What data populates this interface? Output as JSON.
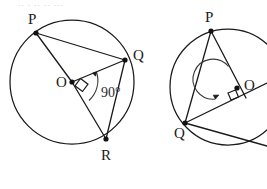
{
  "figure": {
    "title_strip": ".. .  .. .. ...",
    "stroke_color": "#1a1a1a",
    "background_color": "#ffffff",
    "panels": [
      {
        "name": "left-circle-figure",
        "center_label": "O",
        "vertex_labels": [
          "P",
          "Q",
          "R"
        ],
        "angle_label": "90°",
        "circle": {
          "cx": 72,
          "cy": 82,
          "r": 62
        },
        "center_point": {
          "x": 72,
          "y": 82
        },
        "points": {
          "P": {
            "x": 36,
            "y": 33
          },
          "Q": {
            "x": 125,
            "y": 60
          },
          "R": {
            "x": 106,
            "y": 139
          }
        },
        "segments": [
          {
            "from": "O",
            "to": "P"
          },
          {
            "from": "O",
            "to": "Q"
          },
          {
            "from": "O",
            "to": "R"
          },
          {
            "from": "P",
            "to": "Q"
          },
          {
            "from": "Q",
            "to": "R"
          }
        ],
        "right_angle_at": "O",
        "arc_between": [
          "Q",
          "R"
        ]
      },
      {
        "name": "right-circle-figure",
        "center_label": "O",
        "vertex_labels": [
          "P",
          "Q"
        ],
        "angle_label": "",
        "circle": {
          "cx": 228,
          "cy": 87,
          "r": 58
        },
        "center_point": {
          "x": 228,
          "y": 87
        },
        "points": {
          "P": {
            "x": 211,
            "y": 31
          },
          "Q": {
            "x": 185,
            "y": 123
          }
        },
        "segments": [
          {
            "from": "P",
            "to": "O"
          },
          {
            "from": "Q",
            "to": "O"
          },
          {
            "from": "P",
            "to": "Q"
          },
          {
            "from": "Q",
            "to": "edge-right"
          },
          {
            "from": "P",
            "to": "edge-right"
          }
        ],
        "right_angle_at": "O",
        "reflex_arc_at": "O"
      }
    ],
    "labels": {
      "left_P": "P",
      "left_Q": "Q",
      "left_R": "R",
      "left_O": "O",
      "left_angle": "90°",
      "right_P": "P",
      "right_Q": "Q",
      "right_O": "O"
    }
  }
}
